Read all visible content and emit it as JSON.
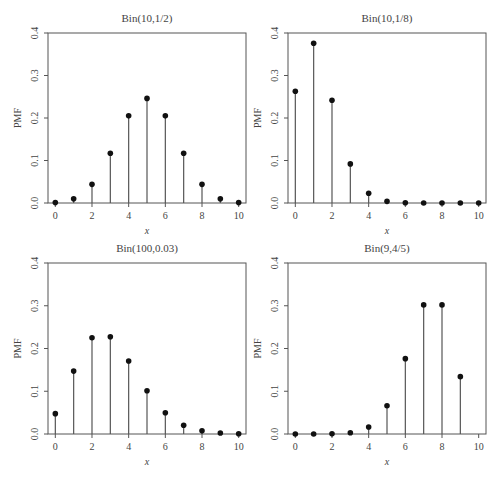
{
  "chart_data": [
    {
      "type": "stem",
      "title": "Bin(10,1/2)",
      "xlabel": "x",
      "ylabel": "PMF",
      "x": [
        0,
        1,
        2,
        3,
        4,
        5,
        6,
        7,
        8,
        9,
        10
      ],
      "values": [
        0.001,
        0.0098,
        0.0439,
        0.1172,
        0.2051,
        0.2461,
        0.2051,
        0.1172,
        0.0439,
        0.0098,
        0.001
      ],
      "xticks": [
        "0",
        "2",
        "4",
        "6",
        "8",
        "10"
      ],
      "yticks": [
        "0.0",
        "0.1",
        "0.2",
        "0.3",
        "0.4"
      ],
      "xlim": [
        0,
        10
      ],
      "ylim": [
        0,
        0.4
      ],
      "grid": false,
      "box": {
        "left": 48,
        "top": 33,
        "right": 246,
        "bottom": 203
      }
    },
    {
      "type": "stem",
      "title": "Bin(10,1/8)",
      "xlabel": "x",
      "ylabel": "PMF",
      "x": [
        0,
        1,
        2,
        3,
        4,
        5,
        6,
        7,
        8,
        9,
        10
      ],
      "values": [
        0.2631,
        0.3758,
        0.2416,
        0.092,
        0.023,
        0.0039,
        0.0005,
        0.0,
        0.0,
        0.0,
        0.0
      ],
      "xticks": [
        "0",
        "2",
        "4",
        "6",
        "8",
        "10"
      ],
      "yticks": [
        "0.0",
        "0.1",
        "0.2",
        "0.3",
        "0.4"
      ],
      "xlim": [
        0,
        10
      ],
      "ylim": [
        0,
        0.4
      ],
      "grid": false,
      "box": {
        "left": 288,
        "top": 33,
        "right": 486,
        "bottom": 203
      }
    },
    {
      "type": "stem",
      "title": "Bin(100,0.03)",
      "xlabel": "x",
      "ylabel": "PMF",
      "x": [
        0,
        1,
        2,
        3,
        4,
        5,
        6,
        7,
        8,
        9,
        10
      ],
      "values": [
        0.0476,
        0.1471,
        0.2252,
        0.2275,
        0.1706,
        0.1013,
        0.0496,
        0.0206,
        0.0074,
        0.0023,
        0.0007
      ],
      "xticks": [
        "0",
        "2",
        "4",
        "6",
        "8",
        "10"
      ],
      "yticks": [
        "0.0",
        "0.1",
        "0.2",
        "0.3",
        "0.4"
      ],
      "xlim": [
        0,
        10
      ],
      "ylim": [
        0,
        0.4
      ],
      "grid": false,
      "box": {
        "left": 48,
        "top": 263,
        "right": 246,
        "bottom": 434
      }
    },
    {
      "type": "stem",
      "title": "Bin(9,4/5)",
      "xlabel": "x",
      "ylabel": "PMF",
      "x": [
        0,
        1,
        2,
        3,
        4,
        5,
        6,
        7,
        8,
        9
      ],
      "values": [
        0.0,
        0.0,
        0.0003,
        0.0028,
        0.0165,
        0.0661,
        0.1762,
        0.302,
        0.302,
        0.1342
      ],
      "xticks": [
        "0",
        "2",
        "4",
        "6",
        "8",
        "10"
      ],
      "yticks": [
        "0.0",
        "0.1",
        "0.2",
        "0.3",
        "0.4"
      ],
      "xlim": [
        0,
        10
      ],
      "ylim": [
        0,
        0.4
      ],
      "grid": false,
      "box": {
        "left": 288,
        "top": 263,
        "right": 486,
        "bottom": 434
      }
    }
  ],
  "style": {
    "stem_color": "#555555",
    "point_color": "#111111",
    "axis_color": "#555555",
    "text_color": "#444444"
  }
}
